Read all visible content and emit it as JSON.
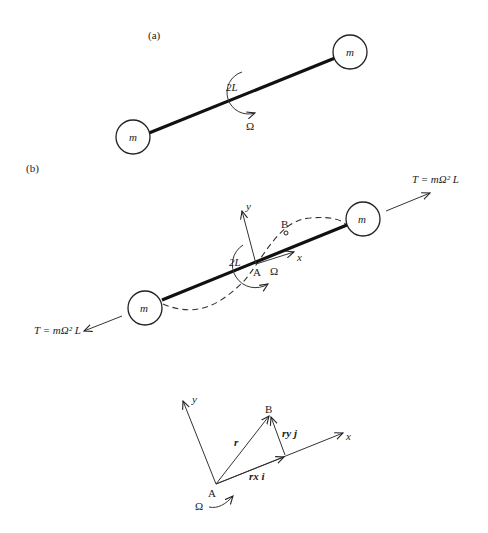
{
  "figure": {
    "panel_a": {
      "label": "(a)",
      "mass_left": "m",
      "mass_right": "m",
      "length_label": "2L",
      "omega_label": "Ω"
    },
    "panel_b": {
      "label": "(b)",
      "mass_left": "m",
      "mass_right": "m",
      "length_label": "2L",
      "omega_label": "Ω",
      "point_a": "A",
      "point_b": "B",
      "axis_x": "x",
      "axis_y": "y",
      "tension_right": "T = mΩ² L",
      "tension_left": "T = mΩ² L"
    },
    "panel_c": {
      "point_a": "A",
      "point_b": "B",
      "axis_x": "x",
      "axis_y": "y",
      "vector_r": "r",
      "vector_rx": "rx i",
      "vector_ry": "ry j",
      "omega_label": "Ω"
    }
  }
}
